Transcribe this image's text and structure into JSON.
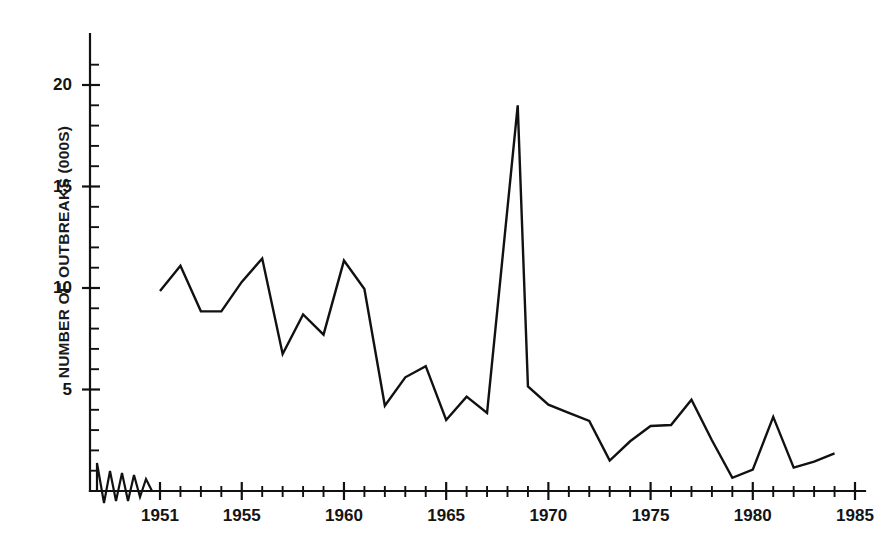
{
  "figure": {
    "background_color": "#ffffff",
    "ink_color": "#111111"
  },
  "chart_data": {
    "type": "line",
    "title": "",
    "subtitle": "",
    "xlabel": "",
    "ylabel": "NUMBER OF OUTBREAKS (000S)",
    "grid": false,
    "legend": null,
    "legend_position": "none",
    "xlim": [
      1949,
      1985.6
    ],
    "ylim": [
      0,
      21.8
    ],
    "x_major_ticks": [
      1951,
      1955,
      1960,
      1965,
      1970,
      1975,
      1980,
      1985
    ],
    "x_major_tick_labels": [
      "1951",
      "1955",
      "1960",
      "1965",
      "1970",
      "1975",
      "1980",
      "1985"
    ],
    "x_minor_tick_interval": 1,
    "y_major_ticks": [
      5,
      10,
      15,
      20
    ],
    "y_major_tick_labels": [
      "5",
      "10",
      "15",
      "20"
    ],
    "y_minor_tick_interval": 1,
    "axis_break_marker": true,
    "axis_break_note": "zigzag break on the x-axis between the origin and 1951",
    "line_color": "#111111",
    "line_width": 2.4,
    "series": [
      {
        "name": "Number of outbreaks",
        "units": "thousands",
        "x": [
          1951,
          1952,
          1953,
          1954,
          1955,
          1956,
          1957,
          1958,
          1959,
          1960,
          1961,
          1962,
          1963,
          1964,
          1965,
          1966,
          1967,
          1968.5,
          1969,
          1970,
          1971,
          1972,
          1973,
          1974,
          1975,
          1976,
          1977,
          1978,
          1979,
          1980,
          1981,
          1982,
          1983,
          1984
        ],
        "values": [
          9.85,
          11.1,
          8.85,
          8.85,
          10.3,
          11.45,
          6.75,
          8.7,
          7.7,
          11.35,
          9.95,
          4.2,
          5.6,
          6.15,
          3.5,
          4.65,
          3.85,
          19.0,
          5.15,
          4.25,
          3.85,
          3.45,
          1.5,
          2.45,
          3.2,
          3.25,
          4.5,
          2.5,
          0.65,
          1.05,
          3.65,
          1.15,
          1.45,
          1.85
        ]
      }
    ]
  }
}
